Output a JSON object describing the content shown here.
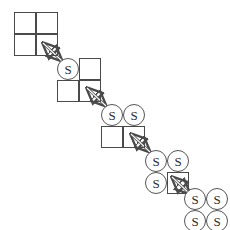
{
  "diagram": {
    "background_color": "#ffffff",
    "line_color": "#4a4a4a",
    "circle_stroke_color": "#555555",
    "glyph_color": "#2b2b2b",
    "allele_symbol": "S",
    "stages": [
      {
        "id": "stage-0",
        "label": "empty-2x2-grid",
        "x": 14,
        "y": 12,
        "size": 44,
        "s_count": 0,
        "cells": [
          {
            "pos": "r0c0",
            "type": "square",
            "value": ""
          },
          {
            "pos": "r0c1",
            "type": "square",
            "value": ""
          },
          {
            "pos": "r1c0",
            "type": "square",
            "value": ""
          },
          {
            "pos": "r1c1",
            "type": "square",
            "value": ""
          }
        ]
      },
      {
        "id": "stage-1",
        "label": "one-s-allele",
        "x": 57,
        "y": 58,
        "size": 44,
        "s_count": 1,
        "cells": [
          {
            "pos": "r0c0",
            "type": "circle",
            "value": "S"
          },
          {
            "pos": "r0c1",
            "type": "square",
            "value": ""
          },
          {
            "pos": "r1c0",
            "type": "square",
            "value": ""
          },
          {
            "pos": "r1c1",
            "type": "square",
            "value": ""
          }
        ]
      },
      {
        "id": "stage-2",
        "label": "two-s-alleles",
        "x": 101,
        "y": 104,
        "size": 44,
        "s_count": 2,
        "cells": [
          {
            "pos": "r0c0",
            "type": "circle",
            "value": "S"
          },
          {
            "pos": "r0c1",
            "type": "circle",
            "value": "S"
          },
          {
            "pos": "r1c0",
            "type": "square",
            "value": ""
          },
          {
            "pos": "r1c1",
            "type": "square",
            "value": ""
          }
        ]
      },
      {
        "id": "stage-3",
        "label": "three-s-alleles",
        "x": 145,
        "y": 150,
        "size": 44,
        "s_count": 3,
        "cells": [
          {
            "pos": "r0c0",
            "type": "circle",
            "value": "S"
          },
          {
            "pos": "r0c1",
            "type": "circle",
            "value": "S"
          },
          {
            "pos": "r1c0",
            "type": "circle",
            "value": "S"
          },
          {
            "pos": "r1c1",
            "type": "square",
            "value": ""
          }
        ]
      },
      {
        "id": "stage-4",
        "label": "four-s-alleles",
        "x": 184,
        "y": 188,
        "size": 44,
        "s_count": 4,
        "cells": [
          {
            "pos": "r0c0",
            "type": "circle",
            "value": "S"
          },
          {
            "pos": "r0c1",
            "type": "circle",
            "value": "S"
          },
          {
            "pos": "r1c0",
            "type": "circle",
            "value": "S"
          },
          {
            "pos": "r1c1",
            "type": "circle",
            "value": "S"
          }
        ]
      }
    ],
    "connectors": [
      {
        "id": "arrow-0",
        "from": "stage-0",
        "to": "stage-1",
        "style": "double-headed",
        "x1": 43,
        "y1": 43,
        "x2": 62,
        "y2": 61
      },
      {
        "id": "arrow-1",
        "from": "stage-1",
        "to": "stage-2",
        "style": "double-headed",
        "x1": 87,
        "y1": 88,
        "x2": 106,
        "y2": 106
      },
      {
        "id": "arrow-2",
        "from": "stage-2",
        "to": "stage-3",
        "style": "double-headed",
        "x1": 131,
        "y1": 134,
        "x2": 150,
        "y2": 152
      },
      {
        "id": "arrow-3",
        "from": "stage-3",
        "to": "stage-4",
        "style": "double-headed",
        "x1": 172,
        "y1": 177,
        "x2": 190,
        "y2": 194
      }
    ]
  }
}
